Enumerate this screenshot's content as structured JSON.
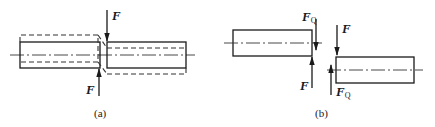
{
  "figure_a": {
    "caption": "(a)",
    "force_top": {
      "symbol": "F",
      "subscript": ""
    },
    "force_bottom": {
      "symbol": "F",
      "subscript": ""
    }
  },
  "figure_b": {
    "caption": "(b)",
    "left_shear": {
      "symbol": "F",
      "subscript": "Q"
    },
    "left_force": {
      "symbol": "F",
      "subscript": ""
    },
    "right_force": {
      "symbol": "F",
      "subscript": ""
    },
    "right_shear": {
      "symbol": "F",
      "subscript": "Q"
    }
  },
  "colors": {
    "line": "#1a1a1a",
    "background": "#ffffff"
  }
}
